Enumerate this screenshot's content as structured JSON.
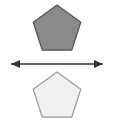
{
  "canvas": {
    "width": 113,
    "height": 126,
    "background_color": "#ffffff"
  },
  "figure": {
    "title": "Two congruent pentagons separated by a horizontal double-headed arrow",
    "description": "A dark gray regular pentagon above a light gray regular pentagon, with a horizontal double-headed arrow drawn between them."
  },
  "shapes": {
    "top_pentagon": {
      "name": "Top pentagon",
      "sides": 5,
      "orientation": "apex-up",
      "fill_color": "#8a8a8a",
      "stroke_color": "#555555",
      "stroke_width": 1.2,
      "center_x": 57,
      "center_y": 30,
      "radius": 25,
      "points": "57,5 80.78,22.28 71.70,50.22 42.30,50.22 33.22,22.28"
    },
    "bottom_pentagon": {
      "name": "Bottom pentagon",
      "sides": 5,
      "orientation": "apex-up",
      "fill_color": "#f0f0f0",
      "stroke_color": "#9a9a9a",
      "stroke_width": 1.2,
      "center_x": 57,
      "center_y": 97,
      "radius": 25,
      "points": "57,72 80.78,89.28 71.70,117.22 42.30,117.22 33.22,89.28"
    }
  },
  "arrow": {
    "name": "Horizontal double-headed arrow",
    "direction": "bidirectional",
    "color": "#333333",
    "line_width": 1.4,
    "y": 64,
    "x_start": 11,
    "x_end": 103,
    "head_length": 9,
    "head_half_width": 4,
    "left_head_points": "11,64 20,60 20,68",
    "right_head_points": "103,64 94,60 94,68",
    "label": ""
  }
}
